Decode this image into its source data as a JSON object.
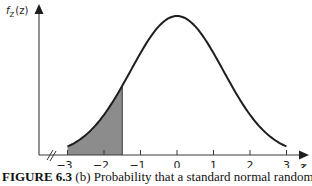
{
  "chart_data": {
    "type": "area",
    "title": "",
    "function": "standard normal density",
    "ylabel_main": "f",
    "ylabel_sub": "Z",
    "ylabel_arg": "(z)",
    "xlabel": "z",
    "xlim": [
      -3,
      3
    ],
    "xticks": [
      -3,
      -2,
      -1,
      0,
      1,
      2,
      3
    ],
    "xtick_labels": [
      "−3",
      "−2",
      "−1",
      "0",
      "1",
      "2",
      "3"
    ],
    "shaded_region": {
      "from": -3,
      "to": -1.5
    },
    "axis_break": true,
    "grid": false,
    "legend": "none"
  },
  "caption": {
    "label": "FIGURE 6.3",
    "text": "(b) Probability that a standard normal random"
  },
  "colors": {
    "shade": "#8c8c8c",
    "curve": "#1e1e1e",
    "axis": "#3a3a3a"
  }
}
